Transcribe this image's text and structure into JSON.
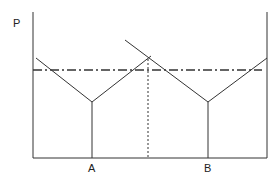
{
  "diagram": {
    "axis_label_y": "P",
    "point_labels": [
      "A",
      "B"
    ],
    "colors": {
      "line": "#333333",
      "background": "#ffffff"
    },
    "elements": {
      "y_axis": "vertical price axis",
      "x_axis": "horizontal baseline",
      "v_curve_a": "V-shaped curve with minimum at A",
      "v_curve_b": "V-shaped curve with minimum at B",
      "dash_dot_line": "horizontal dash-dot price level line",
      "dotted_line": "vertical dotted line from curve intersection",
      "right_boundary": "vertical line at right edge"
    }
  }
}
